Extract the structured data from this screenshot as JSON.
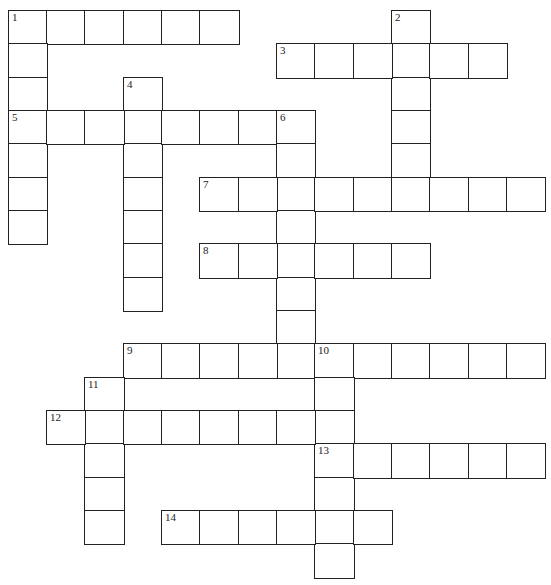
{
  "puzzle": {
    "type": "crossword",
    "col_x": [
      8,
      46,
      84,
      123,
      161,
      199,
      238,
      276,
      314,
      353,
      391,
      429,
      468,
      506,
      544
    ],
    "row_y": [
      10,
      43,
      77,
      110,
      143,
      177,
      210,
      243,
      277,
      310,
      343,
      377,
      410,
      443,
      477,
      510,
      543,
      577
    ],
    "entries": [
      {
        "number": "1",
        "dir": "across",
        "row": 0,
        "col": 0,
        "length": 6
      },
      {
        "number": "1",
        "dir": "down",
        "row": 0,
        "col": 0,
        "length": 7
      },
      {
        "number": "2",
        "dir": "down",
        "row": 0,
        "col": 10,
        "length": 5
      },
      {
        "number": "3",
        "dir": "across",
        "row": 1,
        "col": 7,
        "length": 6
      },
      {
        "number": "4",
        "dir": "down",
        "row": 2,
        "col": 3,
        "length": 7
      },
      {
        "number": "5",
        "dir": "across",
        "row": 3,
        "col": 0,
        "length": 8
      },
      {
        "number": "6",
        "dir": "down",
        "row": 3,
        "col": 7,
        "length": 8
      },
      {
        "number": "7",
        "dir": "across",
        "row": 5,
        "col": 5,
        "length": 9
      },
      {
        "number": "8",
        "dir": "across",
        "row": 7,
        "col": 5,
        "length": 6
      },
      {
        "number": "9",
        "dir": "across",
        "row": 10,
        "col": 3,
        "length": 11
      },
      {
        "number": "10",
        "dir": "down",
        "row": 10,
        "col": 8,
        "length": 7
      },
      {
        "number": "11",
        "dir": "down",
        "row": 11,
        "col": 2,
        "length": 5
      },
      {
        "number": "12",
        "dir": "across",
        "row": 12,
        "col": 1,
        "length": 8
      },
      {
        "number": "13",
        "dir": "across",
        "row": 13,
        "col": 8,
        "length": 6
      },
      {
        "number": "14",
        "dir": "across",
        "row": 15,
        "col": 4,
        "length": 6
      }
    ]
  }
}
